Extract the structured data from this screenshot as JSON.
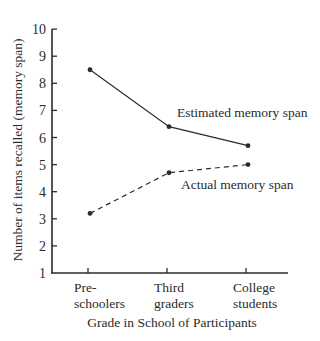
{
  "chart_data": {
    "type": "line",
    "title": "",
    "xlabel": "Grade in School of Participants",
    "ylabel": "Number of items recalled (memory span)",
    "categories": [
      "Pre-schoolers",
      "Third graders",
      "College students"
    ],
    "category_lines": [
      [
        "Pre-",
        "schoolers"
      ],
      [
        "Third",
        "graders"
      ],
      [
        "College",
        "students"
      ]
    ],
    "yticks": [
      1,
      2,
      3,
      4,
      5,
      6,
      7,
      8,
      9,
      10
    ],
    "ylim": [
      1,
      10
    ],
    "grid": false,
    "series": [
      {
        "name": "Estimated memory span",
        "values": [
          8.5,
          6.4,
          5.7
        ],
        "style": "solid"
      },
      {
        "name": "Actual memory span",
        "values": [
          3.2,
          4.7,
          5.0
        ],
        "style": "dashed"
      }
    ],
    "annotations": [
      {
        "text": "Estimated memory span",
        "near_series": 0
      },
      {
        "text": "Actual memory span",
        "near_series": 1
      }
    ],
    "colors": {
      "line": "#2b2b2b",
      "axis": "#2b2b2b",
      "background": "#ffffff"
    }
  }
}
